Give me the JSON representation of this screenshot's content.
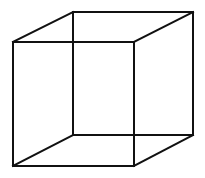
{
  "diagram": {
    "type": "necker-cube-wireframe",
    "background": "#ffffff",
    "stroke_color": "#111111",
    "stroke_width": 2,
    "vertices": {
      "front_top_left": [
        13,
        42
      ],
      "front_top_right": [
        134,
        42
      ],
      "front_bottom_left": [
        13,
        166
      ],
      "front_bottom_right": [
        134,
        166
      ],
      "back_top_left": [
        73,
        12
      ],
      "back_top_right": [
        193,
        12
      ],
      "back_bottom_left": [
        73,
        135
      ],
      "back_bottom_right": [
        193,
        135
      ]
    },
    "edges": [
      [
        "front_top_left",
        "front_top_right"
      ],
      [
        "front_top_right",
        "front_bottom_right"
      ],
      [
        "front_bottom_right",
        "front_bottom_left"
      ],
      [
        "front_bottom_left",
        "front_top_left"
      ],
      [
        "back_top_left",
        "back_top_right"
      ],
      [
        "back_top_right",
        "back_bottom_right"
      ],
      [
        "back_bottom_right",
        "back_bottom_left"
      ],
      [
        "back_bottom_left",
        "back_top_left"
      ],
      [
        "front_top_left",
        "back_top_left"
      ],
      [
        "front_top_right",
        "back_top_right"
      ],
      [
        "front_bottom_left",
        "back_bottom_left"
      ],
      [
        "front_bottom_right",
        "back_bottom_right"
      ]
    ]
  }
}
